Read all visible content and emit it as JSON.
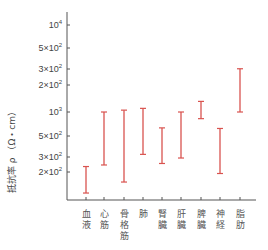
{
  "chart_data": {
    "type": "errorbar",
    "title": "",
    "xlabel": "",
    "ylabel": "抵抗率 ρ （Ω・cm）",
    "yscale": "log",
    "grid": false,
    "legend": null,
    "categories": [
      "血液",
      "心筋",
      "骨格筋",
      "肺",
      "腎臓",
      "肝臓",
      "脾臓",
      "神経",
      "脂肪"
    ],
    "category_labels_vertical": [
      [
        "血",
        "液"
      ],
      [
        "心",
        "筋"
      ],
      [
        "骨",
        "格",
        "筋"
      ],
      [
        "肺"
      ],
      [
        "腎",
        "臓"
      ],
      [
        "肝",
        "臓"
      ],
      [
        "脾",
        "臓"
      ],
      [
        "神",
        "経"
      ],
      [
        "脂",
        "肪"
      ]
    ],
    "ranges": [
      {
        "category": "血液",
        "min": 120,
        "max": 240
      },
      {
        "category": "心筋",
        "min": 250,
        "max": 1000
      },
      {
        "category": "骨格筋",
        "min": 160,
        "max": 1050
      },
      {
        "category": "肺",
        "min": 330,
        "max": 1100
      },
      {
        "category": "腎臓",
        "min": 260,
        "max": 660
      },
      {
        "category": "肝臓",
        "min": 300,
        "max": 1000
      },
      {
        "category": "脾臓",
        "min": 840,
        "max": 1320
      },
      {
        "category": "神経",
        "min": 200,
        "max": 650
      },
      {
        "category": "脂肪",
        "min": 1000,
        "max": 3100
      }
    ],
    "ytick_labels": [
      {
        "base": "10",
        "exp": "4",
        "prefix": ""
      },
      {
        "base": "10",
        "exp": "2",
        "prefix": "5×"
      },
      {
        "base": "10",
        "exp": "2",
        "prefix": "3×"
      },
      {
        "base": "10",
        "exp": "2",
        "prefix": "2×"
      },
      {
        "base": "10",
        "exp": "3",
        "prefix": ""
      },
      {
        "base": "10",
        "exp": "2",
        "prefix": "5×"
      },
      {
        "base": "10",
        "exp": "2",
        "prefix": "3×"
      },
      {
        "base": "10",
        "exp": "2",
        "prefix": "2×"
      }
    ],
    "ylim": [
      100,
      10000
    ],
    "bar_color": "#d9534f"
  }
}
